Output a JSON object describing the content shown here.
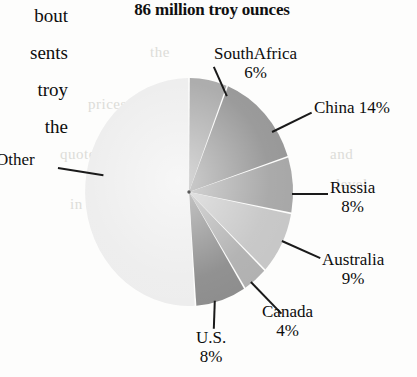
{
  "page": {
    "margin_text_lines": [
      "bout",
      "sents",
      "troy",
      "the"
    ],
    "background_ghost_lines": [
      "the",
      "prices",
      "quoted",
      "in",
      "and",
      "level"
    ]
  },
  "chart_data": {
    "type": "pie",
    "title": "86 million troy ounces",
    "unit": "million troy ounces",
    "total": 86,
    "categories": [
      "SouthAfrica",
      "China",
      "Russia",
      "Australia",
      "Canada",
      "U.S.",
      "Other"
    ],
    "values": [
      6,
      14,
      8,
      9,
      4,
      8,
      51
    ],
    "labels": [
      {
        "name": "SouthAfrica",
        "pct": "6%",
        "value": 6,
        "color": "#a9a9a9",
        "label_mode": "two-line"
      },
      {
        "name": "China 14%",
        "pct": "",
        "value": 14,
        "color": "#969696",
        "label_mode": "one-line"
      },
      {
        "name": "Russia",
        "pct": "8%",
        "value": 8,
        "color": "#a6a6a6",
        "label_mode": "two-line"
      },
      {
        "name": "Australia",
        "pct": "9%",
        "value": 9,
        "color": "#c6c6c6",
        "label_mode": "two-line"
      },
      {
        "name": "Canada",
        "pct": "4%",
        "value": 4,
        "color": "#b0b0b0",
        "label_mode": "two-line"
      },
      {
        "name": "U.S.",
        "pct": "8%",
        "value": 8,
        "color": "#8c8c8c",
        "label_mode": "two-line"
      },
      {
        "name": "Other",
        "pct": "",
        "value": 51,
        "color": "#ededed",
        "label_mode": "one-line"
      }
    ],
    "legend_position": "callout-labels",
    "grid": false,
    "start_angle_deg": 0,
    "direction": "clockwise"
  }
}
